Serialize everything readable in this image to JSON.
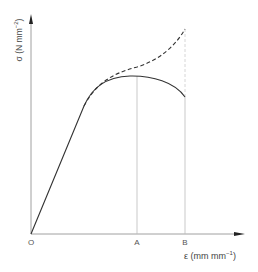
{
  "diagram": {
    "type": "stress-strain curve",
    "y_axis": {
      "symbol": "σ",
      "unit_base": "(N mm",
      "unit_exp": "−2",
      "unit_close": ")"
    },
    "x_axis": {
      "symbol": "ε",
      "unit_base": "(mm mm",
      "unit_exp": "−1",
      "unit_close": ")"
    },
    "ticks": {
      "origin": "O",
      "a": "A",
      "b": "B"
    },
    "curves": [
      {
        "name": "engineering-stress",
        "style": "solid",
        "description": "rises linearly, reaches maximum at A, falls to fracture at B"
      },
      {
        "name": "true-stress",
        "style": "dashed",
        "description": "diverges after yield and keeps rising to B"
      }
    ],
    "colors": {
      "line": "#333333",
      "guide": "#bbbbbb",
      "text": "#444444"
    }
  }
}
